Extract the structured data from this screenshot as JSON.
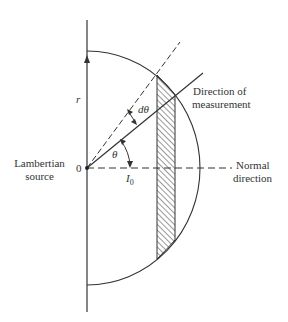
{
  "labels": {
    "r": "r",
    "d_theta": "dθ",
    "direction_of_measurement_line1": "Direction of",
    "direction_of_measurement_line2": "measurement",
    "lambertian_line1": "Lambertian",
    "lambertian_line2": "source",
    "origin": "0",
    "theta": "θ",
    "i0": "I",
    "i0_sub": "0",
    "normal_line1": "Normal",
    "normal_line2": "direction"
  },
  "colors": {
    "line": "#333333",
    "background": "#ffffff"
  }
}
